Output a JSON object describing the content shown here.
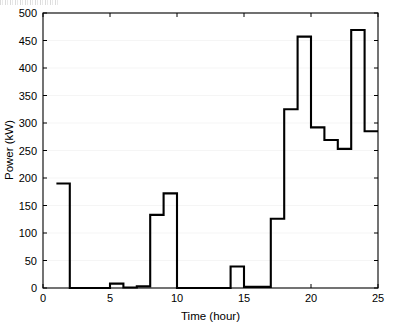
{
  "figure": {
    "background_color": "#ffffff",
    "line_color": "#000000",
    "axis_color": "#000000",
    "grid_color": "#f0f0f0"
  },
  "chart_data": {
    "type": "line",
    "subtype": "step-post",
    "title": "",
    "xlabel": "Time (hour)",
    "ylabel": "Power (kW)",
    "xlim": [
      0,
      25
    ],
    "ylim": [
      0,
      500
    ],
    "xticks": [
      0,
      5,
      10,
      15,
      20,
      25
    ],
    "xtick_labels": [
      "0",
      "5",
      "10",
      "15",
      "20",
      "25"
    ],
    "yticks": [
      0,
      50,
      100,
      150,
      200,
      250,
      300,
      350,
      400,
      450,
      500
    ],
    "ytick_labels": [
      "0",
      "50",
      "100",
      "150",
      "200",
      "250",
      "300",
      "350",
      "400",
      "450",
      "500"
    ],
    "grid": false,
    "legend": null,
    "series": [
      {
        "name": "Power",
        "color": "#000000",
        "x": [
          1,
          2,
          3,
          4,
          5,
          6,
          7,
          8,
          9,
          10,
          11,
          12,
          13,
          14,
          15,
          16,
          17,
          18,
          19,
          20,
          21,
          22,
          23,
          24
        ],
        "values": [
          190,
          0,
          0,
          0,
          8,
          1,
          3,
          133,
          172,
          0,
          0,
          0,
          0,
          39,
          2,
          2,
          126,
          325,
          457,
          292,
          269,
          253,
          469,
          285
        ]
      }
    ],
    "annotations": []
  },
  "axis_titles": {
    "x": "Time (hour)",
    "y": "Power (kW)"
  }
}
